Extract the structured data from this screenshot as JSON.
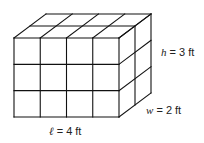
{
  "diagram": {
    "type": "rectangular-prism-unit-cubes",
    "grid": {
      "length_units": 4,
      "width_units": 2,
      "height_units": 3
    },
    "labels": {
      "height": {
        "var": "h",
        "text": " = 3 ft"
      },
      "width": {
        "var": "w",
        "text": " = 2 ft"
      },
      "length": {
        "var": "ℓ",
        "text": " = 4 ft"
      }
    },
    "colors": {
      "line": "#111111",
      "background": "#ffffff"
    }
  }
}
